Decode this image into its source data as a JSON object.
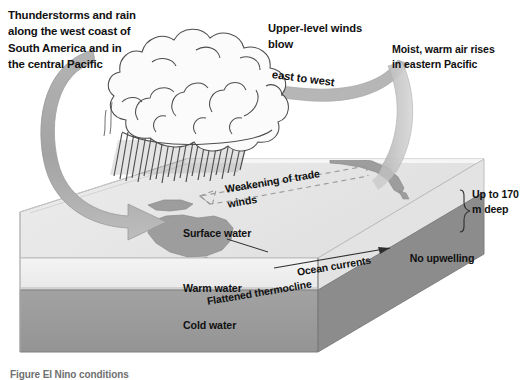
{
  "figure": {
    "caption": "Figure  El Nino conditions"
  },
  "labels": {
    "thunderstorms": "Thunderstorms and rain along the west coast of South America and in the central Pacific",
    "upper_winds": "Upper-level winds blow",
    "east_to_west": "east to west",
    "moist_warm": "Moist, warm air rises in eastern Pacific",
    "weakening_trade_winds": "Weakening of trade winds",
    "surface_water": "Surface water",
    "ocean_currents": "Ocean currents",
    "no_upwelling": "No upwelling",
    "flattened_thermocline": "Flattened thermocline",
    "warm_water": "Warm water",
    "cold_water": "Cold water",
    "depth": "Up to 170 m deep"
  },
  "icons": {
    "storm_cloud": "cumulonimbus-cloud-icon",
    "rain": "rain-streaks-icon",
    "left_arrow": "curved-descending-arrow-icon",
    "right_arrow": "curved-rising-arrow-icon",
    "upper_wind_arrow": "upper-level-wind-arrow-icon",
    "trade_wind_arrow": "dashed-weak-trade-wind-arrow-icon",
    "current_arrow": "ocean-current-arrow-icon",
    "depth_brace": "depth-brace-icon",
    "australia": "australia-landmass-icon",
    "new_guinea": "new-guinea-landmass-icon",
    "south_america": "south-america-landmass-icon"
  },
  "colors": {
    "background": "#ffffff",
    "surface_top": "#e6e6e6",
    "surface_front": "#efefef",
    "warm_layer": "#f0f0f0",
    "cold_layer": "#9a9a9a",
    "cold_side": "#8a8a8a",
    "land": "#9d9d9d",
    "arrow_gray": "#a8a8a8",
    "text": "#111111",
    "rain": "#3c3c3c",
    "cloud_outline": "#4a4a4a",
    "cloud_fill": "#fbfbfb"
  }
}
